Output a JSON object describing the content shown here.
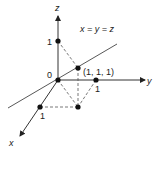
{
  "diagram": {
    "axes": {
      "x_label": "x",
      "y_label": "y",
      "z_label": "z"
    },
    "line_label": "x = y = z",
    "origin_label": "0",
    "point_label": "(1, 1, 1)",
    "tick_labels": {
      "x": "1",
      "y": "1",
      "z": "1"
    },
    "colors": {
      "ink": "#222222",
      "background": "#ffffff"
    }
  }
}
